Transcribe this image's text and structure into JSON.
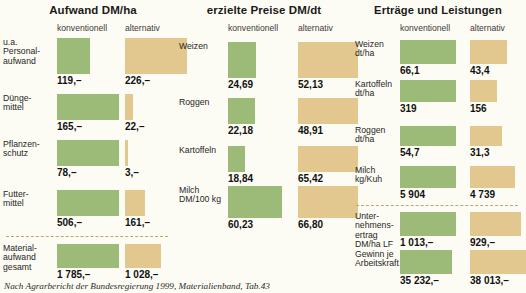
{
  "footer": "Nach Agrarbericht der Bundesregierung 1999, Materialienband, Tab.43",
  "colors": {
    "conventional": "#9cbb78",
    "alternative": "#e2c78e",
    "background": "#fdfcf4",
    "separator": "#b9a86a"
  },
  "series_labels": {
    "conventional": "konventionell",
    "alternative": "alternativ"
  },
  "panels": [
    {
      "title": "Aufwand DM/ha",
      "rows": [
        {
          "label": "u.a.\nPersonal-\naufwand",
          "conventional": "119,–",
          "alternative": "226,–"
        },
        {
          "label": "Dünge-\nmittel",
          "conventional": "165,–",
          "alternative": "22,–"
        },
        {
          "label": "Pflanzen-\nschutz",
          "conventional": "78,–",
          "alternative": "3,–"
        },
        {
          "label": "Futter-\nmittel",
          "conventional": "506,–",
          "alternative": "161,–"
        },
        {
          "label": "Material-\naufwand\ngesamt",
          "conventional": "1 785,–",
          "alternative": "1 028,–"
        }
      ]
    },
    {
      "title": "erzielte Preise DM/dt",
      "rows": [
        {
          "label": "Weizen",
          "conventional": "24,69",
          "alternative": "52,13"
        },
        {
          "label": "Roggen",
          "conventional": "22,18",
          "alternative": "48,91"
        },
        {
          "label": "Kartoffeln",
          "conventional": "18,84",
          "alternative": "65,42"
        },
        {
          "label": "Milch\nDM/100 kg",
          "conventional": "60,23",
          "alternative": "66,80"
        }
      ]
    },
    {
      "title": "Erträge und Leistungen",
      "rows": [
        {
          "label": "Weizen\ndt/ha",
          "conventional": "66,1",
          "alternative": "43,4"
        },
        {
          "label": "Kartoffeln\ndt/ha",
          "conventional": "319",
          "alternative": "156"
        },
        {
          "label": "Roggen\ndt/ha",
          "conventional": "54,7",
          "alternative": "31,3"
        },
        {
          "label": "Milch\nkg/Kuh",
          "conventional": "5 904",
          "alternative": "4 739"
        },
        {
          "label": "Unter-\nnehmens-\nertrag\nDM/ha LF",
          "conventional": "1 013,–",
          "alternative": "929,–"
        },
        {
          "label": "Gewinn je\nArbeitskraft",
          "conventional": "35 232,–",
          "alternative": "38 013,–"
        }
      ]
    }
  ],
  "chart_data": {
    "type": "bar",
    "orientation": "horizontal",
    "legend": [
      "konventionell",
      "alternativ"
    ],
    "legend_position": "column-headers",
    "grid": false,
    "panels": [
      {
        "title": "Aufwand DM/ha",
        "unit": "DM/ha",
        "categories": [
          "u.a. Personalaufwand",
          "Düngemittel",
          "Pflanzenschutz",
          "Futtermittel",
          "Materialaufwand gesamt"
        ],
        "series": [
          {
            "name": "konventionell",
            "values": [
              119,
              165,
              78,
              506,
              1785
            ]
          },
          {
            "name": "alternativ",
            "values": [
              226,
              22,
              3,
              161,
              1028
            ]
          }
        ]
      },
      {
        "title": "erzielte Preise DM/dt",
        "unit": "DM/dt",
        "categories": [
          "Weizen",
          "Roggen",
          "Kartoffeln",
          "Milch DM/100 kg"
        ],
        "series": [
          {
            "name": "konventionell",
            "values": [
              24.69,
              22.18,
              18.84,
              60.23
            ]
          },
          {
            "name": "alternativ",
            "values": [
              52.13,
              48.91,
              65.42,
              66.8
            ]
          }
        ]
      },
      {
        "title": "Erträge und Leistungen",
        "unit": "gemischt",
        "categories": [
          "Weizen dt/ha",
          "Kartoffeln dt/ha",
          "Roggen dt/ha",
          "Milch kg/Kuh",
          "Unternehmensertrag DM/ha LF",
          "Gewinn je Arbeitskraft"
        ],
        "series": [
          {
            "name": "konventionell",
            "values": [
              66.1,
              319,
              54.7,
              5904,
              1013,
              35232
            ]
          },
          {
            "name": "alternativ",
            "values": [
              43.4,
              156,
              31.3,
              4739,
              929,
              38013
            ]
          }
        ]
      }
    ]
  }
}
